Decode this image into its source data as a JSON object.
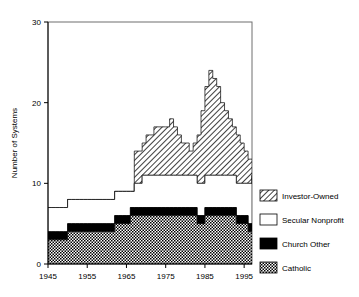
{
  "chart_data": {
    "type": "area",
    "stacked": true,
    "title": "",
    "xlabel": "",
    "ylabel": "Number of Systems",
    "xlim": [
      1945,
      1997
    ],
    "ylim": [
      0,
      30
    ],
    "xticks": [
      1945,
      1955,
      1965,
      1975,
      1985,
      1995
    ],
    "yticks": [
      0,
      10,
      20,
      30
    ],
    "grid": false,
    "legend_position": "right",
    "legend_entries": [
      {
        "label": "Investor-Owned",
        "pattern": "diagonal-hatch"
      },
      {
        "label": "Secular Nonprofit",
        "pattern": "white-empty"
      },
      {
        "label": "Church Other",
        "pattern": "solid-black"
      },
      {
        "label": "Catholic",
        "pattern": "checkerboard"
      }
    ],
    "x": [
      1945,
      1946,
      1947,
      1948,
      1949,
      1950,
      1951,
      1952,
      1953,
      1954,
      1955,
      1956,
      1957,
      1958,
      1959,
      1960,
      1961,
      1962,
      1963,
      1964,
      1965,
      1966,
      1967,
      1968,
      1969,
      1970,
      1971,
      1972,
      1973,
      1974,
      1975,
      1976,
      1977,
      1978,
      1979,
      1980,
      1981,
      1982,
      1983,
      1984,
      1985,
      1986,
      1987,
      1988,
      1989,
      1990,
      1991,
      1992,
      1993,
      1994,
      1995,
      1996,
      1997
    ],
    "series": [
      {
        "name": "Catholic",
        "pattern": "checkerboard",
        "values": [
          3,
          3,
          3,
          3,
          3,
          4,
          4,
          4,
          4,
          4,
          4,
          4,
          4,
          4,
          4,
          4,
          4,
          5,
          5,
          5,
          5,
          6,
          6,
          6,
          6,
          6,
          6,
          6,
          6,
          6,
          6,
          6,
          6,
          6,
          6,
          6,
          6,
          6,
          5,
          5,
          6,
          6,
          6,
          6,
          6,
          6,
          6,
          6,
          5,
          5,
          5,
          4,
          4
        ]
      },
      {
        "name": "Church Other",
        "pattern": "solid-black",
        "values": [
          1,
          1,
          1,
          1,
          1,
          1,
          1,
          1,
          1,
          1,
          1,
          1,
          1,
          1,
          1,
          1,
          1,
          1,
          1,
          1,
          1,
          1,
          1,
          1,
          1,
          1,
          1,
          1,
          1,
          1,
          1,
          1,
          1,
          1,
          1,
          1,
          1,
          1,
          1,
          1,
          1,
          1,
          1,
          1,
          1,
          1,
          1,
          1,
          1,
          1,
          1,
          1,
          1
        ]
      },
      {
        "name": "Secular Nonprofit",
        "pattern": "white-empty",
        "values": [
          3,
          3,
          3,
          3,
          3,
          3,
          3,
          3,
          3,
          3,
          3,
          3,
          3,
          3,
          3,
          3,
          3,
          3,
          3,
          3,
          3,
          2,
          3,
          3,
          4,
          4,
          4,
          4,
          4,
          4,
          4,
          4,
          4,
          4,
          4,
          4,
          4,
          4,
          4,
          4,
          4,
          4,
          4,
          4,
          4,
          4,
          4,
          4,
          4,
          4,
          4,
          5,
          6
        ]
      },
      {
        "name": "Investor-Owned",
        "pattern": "diagonal-hatch",
        "values": [
          0,
          0,
          0,
          0,
          0,
          0,
          0,
          0,
          0,
          0,
          0,
          0,
          0,
          0,
          0,
          0,
          0,
          0,
          0,
          0,
          0,
          0,
          4,
          4,
          4,
          5,
          5,
          6,
          6,
          6,
          6,
          7,
          6,
          5,
          4,
          4,
          3,
          4,
          6,
          9,
          11,
          13,
          12,
          11,
          9,
          8,
          7,
          6,
          6,
          5,
          4,
          3,
          2
        ]
      }
    ],
    "totals_note": "Stacked totals peak near 24 in 1986"
  },
  "axis": {
    "y_title": "Number of Systems",
    "y_tick_labels": [
      "30",
      "20",
      "10",
      "0"
    ],
    "x_tick_labels": [
      "1945",
      "1955",
      "1965",
      "1975",
      "1985",
      "1995"
    ]
  },
  "legend": {
    "items": [
      {
        "label": "Investor-Owned"
      },
      {
        "label": "Secular Nonprofit"
      },
      {
        "label": "Church Other"
      },
      {
        "label": "Catholic"
      }
    ]
  },
  "colors": {
    "axis": "#000000",
    "frame": "#555555",
    "black_fill": "#000000",
    "white_fill": "#ffffff",
    "hatch": "#000000",
    "checker": "#000000"
  }
}
